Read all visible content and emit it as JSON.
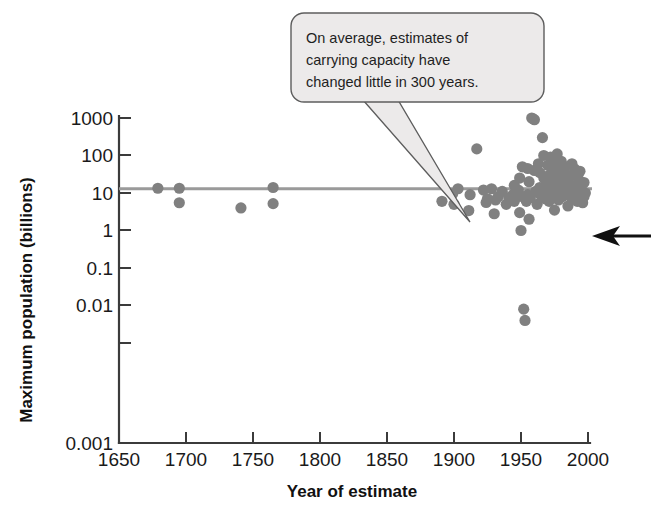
{
  "figure": {
    "background_color": "#ffffff",
    "point_color": "#808080",
    "trend_color": "#9a9a9a",
    "axis_color": "#3b3b3b",
    "callout_fill": "#eceaea",
    "callout_stroke": "#5d5d5d",
    "arrow_color": "#111111"
  },
  "callout": {
    "name": "annotation-callout",
    "lines": [
      "On average, estimates of",
      "carrying capacity have",
      "changed little in 300 years."
    ],
    "full_text": "On average, estimates of carrying capacity have changed little in 300 years."
  },
  "chart_data": {
    "type": "scatter",
    "title": "",
    "subtitle": "",
    "xlabel": "Year of estimate",
    "ylabel": "Maximum population (billions)",
    "xlim": [
      1650,
      2000
    ],
    "ylim": [
      0.001,
      1000
    ],
    "yscale": "log",
    "xscale": "linear",
    "grid": false,
    "legend": false,
    "legend_position": "none",
    "xticks": [
      1650,
      1700,
      1750,
      1800,
      1850,
      1900,
      1950,
      2000
    ],
    "xtick_labels": [
      "1650",
      "1700",
      "1750",
      "1800",
      "1850",
      "1900",
      "1950",
      "2000"
    ],
    "yticks": [
      1000,
      100,
      10,
      1,
      0.1,
      0.01,
      0.001
    ],
    "ytick_labels": [
      "1000",
      "100",
      "10",
      "1",
      "0.1",
      "0.01",
      "0.001"
    ],
    "annotations": [
      {
        "name": "trend-line",
        "kind": "hline",
        "y": 13,
        "x_start": 1650,
        "x_end": 2000,
        "label": "average estimate of carrying capacity"
      },
      {
        "name": "pointer-arrow",
        "kind": "arrow",
        "points_to_x": 1998,
        "points_to_y": 9,
        "direction": "left",
        "label": "current world population indicator"
      }
    ],
    "series": [
      {
        "name": "Estimates of maximum human population",
        "marker": "circle",
        "color": "#808080",
        "x": [
          1679,
          1695,
          1695,
          1741,
          1765,
          1765,
          1891,
          1899,
          1900,
          1903,
          1911,
          1912,
          1917,
          1922,
          1924,
          1925,
          1928,
          1930,
          1931,
          1933,
          1936,
          1939,
          1941,
          1944,
          1945,
          1945,
          1948,
          1949,
          1949,
          1950,
          1951,
          1951,
          1952,
          1953,
          1954,
          1955,
          1955,
          1956,
          1956,
          1957,
          1958,
          1959,
          1960,
          1960,
          1961,
          1962,
          1963,
          1964,
          1964,
          1965,
          1966,
          1967,
          1967,
          1968,
          1969,
          1970,
          1970,
          1971,
          1971,
          1972,
          1972,
          1973,
          1974,
          1974,
          1975,
          1975,
          1976,
          1976,
          1977,
          1977,
          1978,
          1978,
          1979,
          1980,
          1980,
          1981,
          1982,
          1982,
          1983,
          1984,
          1985,
          1985,
          1986,
          1987,
          1988,
          1988,
          1989,
          1990,
          1990,
          1991,
          1992,
          1993,
          1994,
          1994,
          1995,
          1996,
          1997,
          1997,
          1998
        ],
        "y": [
          13.4,
          13.4,
          5.5,
          4.0,
          5.2,
          14.0,
          6.0,
          9.5,
          5.0,
          13.0,
          3.4,
          9.0,
          150.0,
          12.0,
          5.6,
          7.0,
          13.0,
          2.8,
          6.5,
          8.0,
          11.0,
          5.0,
          7.5,
          9.0,
          16.0,
          6.0,
          12.0,
          3.0,
          25.0,
          1.0,
          8.0,
          50.0,
          0.008,
          0.004,
          6.0,
          45.0,
          9.0,
          2.0,
          20.0,
          7.5,
          1000.0,
          950.0,
          900.0,
          40.0,
          11.0,
          5.0,
          60.0,
          35.0,
          14.0,
          8.5,
          300.0,
          100.0,
          25.0,
          7.0,
          18.0,
          55.0,
          12.0,
          6.0,
          30.0,
          90.0,
          20.0,
          10.0,
          45.0,
          15.0,
          3.5,
          65.0,
          22.0,
          9.0,
          110.0,
          40.0,
          13.0,
          6.5,
          28.0,
          70.0,
          17.0,
          8.0,
          35.0,
          12.0,
          50.0,
          20.0,
          9.5,
          4.5,
          26.0,
          14.0,
          60.0,
          7.0,
          32.0,
          11.0,
          44.0,
          16.0,
          6.0,
          23.0,
          9.0,
          38.0,
          13.0,
          5.5,
          19.0,
          8.0,
          10.0
        ]
      }
    ]
  },
  "axes": {
    "x_title": "Year of estimate",
    "y_title": "Maximum population (billions)"
  }
}
